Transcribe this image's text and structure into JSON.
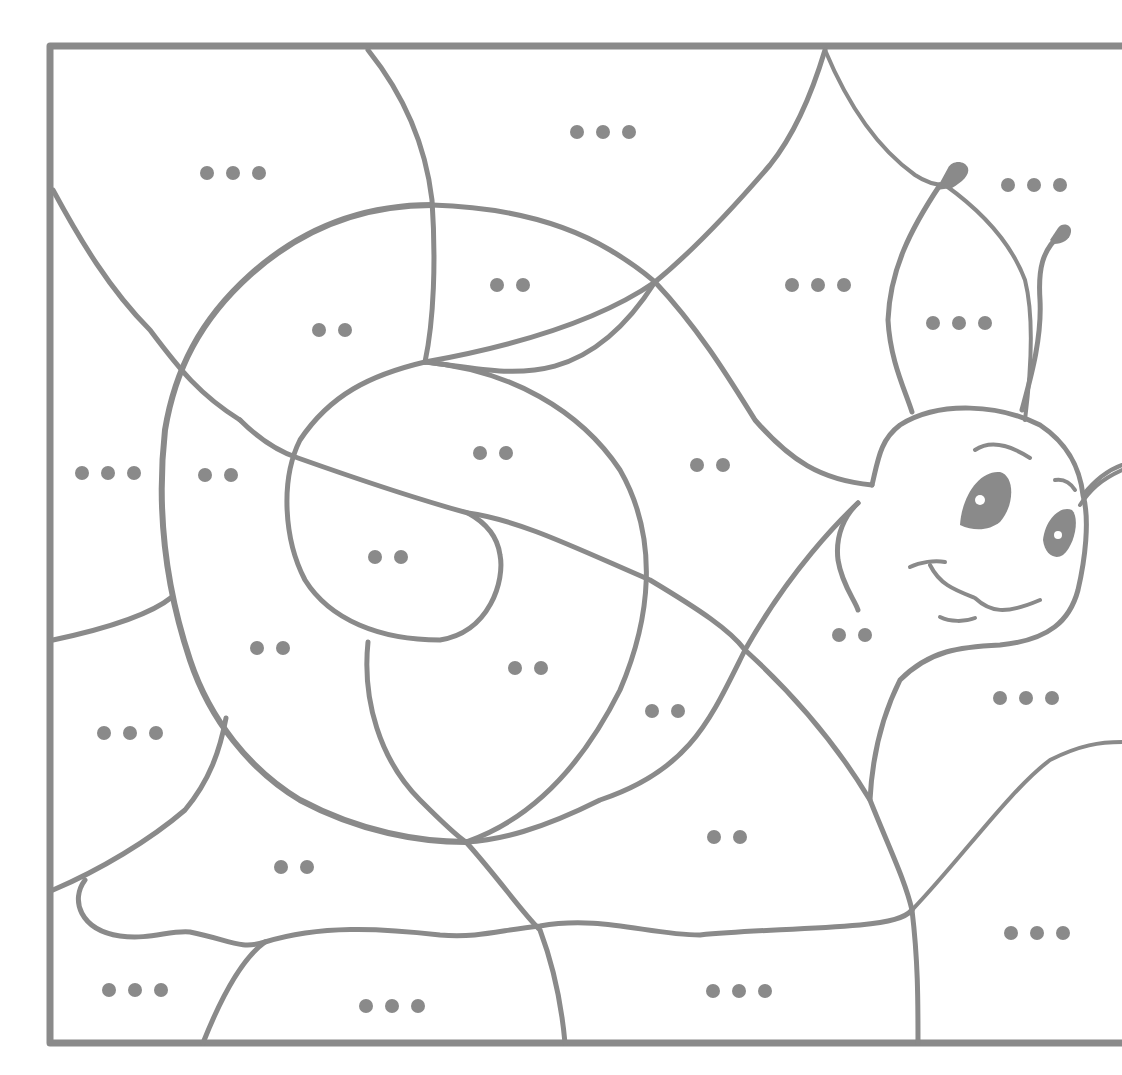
{
  "worksheet": {
    "title": "Snail color-by-dots worksheet",
    "line_color": "#8a8a8a",
    "background": "#ffffff",
    "subject": "snail",
    "legend_note": "Regions marked with two dots or three dots",
    "regions": [
      {
        "id": "r1",
        "dots": 3,
        "x": 232,
        "y": 173
      },
      {
        "id": "r2",
        "dots": 3,
        "x": 598,
        "y": 132
      },
      {
        "id": "r3",
        "dots": 3,
        "x": 1033,
        "y": 185
      },
      {
        "id": "r4",
        "dots": 2,
        "x": 510,
        "y": 285
      },
      {
        "id": "r5",
        "dots": 2,
        "x": 332,
        "y": 330
      },
      {
        "id": "r6",
        "dots": 3,
        "x": 815,
        "y": 285
      },
      {
        "id": "r7",
        "dots": 3,
        "x": 958,
        "y": 323
      },
      {
        "id": "r8",
        "dots": 3,
        "x": 108,
        "y": 473
      },
      {
        "id": "r9",
        "dots": 2,
        "x": 218,
        "y": 475
      },
      {
        "id": "r10",
        "dots": 2,
        "x": 493,
        "y": 453
      },
      {
        "id": "r11",
        "dots": 2,
        "x": 710,
        "y": 465
      },
      {
        "id": "r12",
        "dots": 2,
        "x": 388,
        "y": 557
      },
      {
        "id": "r13",
        "dots": 2,
        "x": 270,
        "y": 648
      },
      {
        "id": "r14",
        "dots": 2,
        "x": 528,
        "y": 668
      },
      {
        "id": "r15",
        "dots": 2,
        "x": 665,
        "y": 711
      },
      {
        "id": "r16",
        "dots": 2,
        "x": 852,
        "y": 635
      },
      {
        "id": "r17",
        "dots": 3,
        "x": 1025,
        "y": 698
      },
      {
        "id": "r18",
        "dots": 3,
        "x": 130,
        "y": 733
      },
      {
        "id": "r19",
        "dots": 2,
        "x": 727,
        "y": 837
      },
      {
        "id": "r20",
        "dots": 2,
        "x": 294,
        "y": 867
      },
      {
        "id": "r21",
        "dots": 3,
        "x": 1036,
        "y": 933
      },
      {
        "id": "r22",
        "dots": 3,
        "x": 134,
        "y": 990
      },
      {
        "id": "r23",
        "dots": 3,
        "x": 391,
        "y": 1006
      },
      {
        "id": "r24",
        "dots": 3,
        "x": 739,
        "y": 991
      }
    ]
  }
}
